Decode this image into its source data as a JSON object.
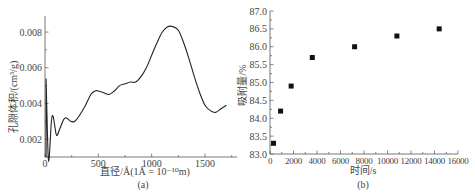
{
  "chart_data": [
    {
      "id": "a",
      "type": "line",
      "caption": "(a)",
      "title": "",
      "xlabel": "直径/Å(1Å = 10⁻¹⁰m)",
      "ylabel": "孔隙体积/(cm³/g)",
      "xlim": [
        0,
        1800
      ],
      "ylim": [
        0.001,
        0.0089
      ],
      "xticks": [
        0,
        500,
        1000,
        1500
      ],
      "xtick_labels": [
        "0",
        "500",
        "1000",
        "1500"
      ],
      "yticks": [
        0.002,
        0.004,
        0.006,
        0.008
      ],
      "ytick_labels": [
        "0.002",
        "0.004",
        "0.006",
        "0.008"
      ],
      "grid": false,
      "series": [
        {
          "name": "pore volume distribution",
          "x": [
            10,
            20,
            30,
            40,
            60,
            75,
            90,
            110,
            140,
            175,
            200,
            240,
            280,
            320,
            380,
            430,
            470,
            500,
            550,
            600,
            650,
            700,
            750,
            800,
            850,
            900,
            950,
            1000,
            1050,
            1100,
            1150,
            1200,
            1250,
            1300,
            1350,
            1400,
            1450,
            1500,
            1550,
            1600,
            1650,
            1700
          ],
          "y": [
            0.0054,
            0.003,
            0.001,
            0.0008,
            0.003,
            0.0033,
            0.0028,
            0.0022,
            0.0026,
            0.0031,
            0.0032,
            0.003,
            0.003,
            0.0033,
            0.0039,
            0.0045,
            0.0047,
            0.0047,
            0.0046,
            0.0045,
            0.0047,
            0.005,
            0.0051,
            0.0052,
            0.0052,
            0.0055,
            0.006,
            0.0067,
            0.0074,
            0.008,
            0.0083,
            0.0083,
            0.0081,
            0.0074,
            0.0065,
            0.0055,
            0.0046,
            0.0039,
            0.0036,
            0.0035,
            0.0037,
            0.0039
          ]
        }
      ]
    },
    {
      "id": "b",
      "type": "scatter",
      "caption": "(b)",
      "title": "",
      "xlabel": "时间/s",
      "ylabel": "吸附量/%",
      "xlim": [
        0,
        16000
      ],
      "ylim": [
        83.0,
        87.0
      ],
      "xticks": [
        0,
        2000,
        4000,
        6000,
        8000,
        10000,
        12000,
        14000,
        16000
      ],
      "xtick_labels": [
        "0",
        "2000",
        "4000",
        "6000",
        "8000",
        "10000",
        "12000",
        "14000",
        "16000"
      ],
      "yticks": [
        83.0,
        83.5,
        84.0,
        84.5,
        85.0,
        85.5,
        86.0,
        86.5,
        87.0
      ],
      "ytick_labels": [
        "83.0",
        "83.5",
        "84.0",
        "84.5",
        "85.0",
        "85.5",
        "86.0",
        "86.5",
        "87.0"
      ],
      "grid": false,
      "marker": "square",
      "series": [
        {
          "name": "adsorption",
          "x": [
            300,
            900,
            1800,
            3600,
            7200,
            10800,
            14400
          ],
          "y": [
            83.3,
            84.2,
            84.9,
            85.7,
            86.0,
            86.3,
            86.5
          ]
        }
      ]
    }
  ]
}
